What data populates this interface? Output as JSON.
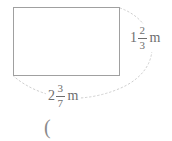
{
  "figure": {
    "type": "rectangle-dimension-diagram",
    "height_label": {
      "whole": "1",
      "numerator": "2",
      "denominator": "3",
      "unit": "m"
    },
    "width_label": {
      "whole": "2",
      "numerator": "3",
      "denominator": "7",
      "unit": "m"
    },
    "answer_prefix": "(",
    "colors": {
      "background": "#ffffff",
      "rectangle_border": "#a0a0a0",
      "arc": "#c9c9c9",
      "text": "#6e6e6e",
      "parenthesis": "#8a8a8a"
    }
  }
}
